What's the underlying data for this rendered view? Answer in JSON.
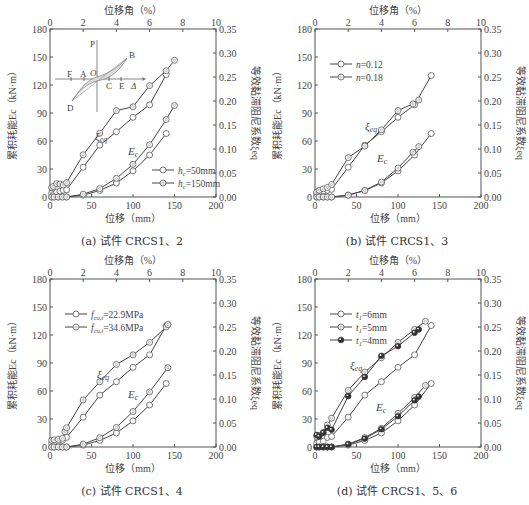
{
  "chart_data": [
    {
      "type": "line",
      "caption": "(a) 试件 CRCS1、2",
      "xlabel": "位移（mm）",
      "x2label": "位移角（%）",
      "ylabel": "累积耗能E_c（kN·m）",
      "y2label": "等效黏滞阻尼系数ξ_eq",
      "xlim": [
        0,
        200
      ],
      "x2lim": [
        0,
        10
      ],
      "ylim": [
        0,
        180
      ],
      "y2lim": [
        0,
        0.35
      ],
      "xticks": [
        0,
        50,
        100,
        150,
        200
      ],
      "x2ticks": [
        0,
        2,
        4,
        6,
        8,
        10
      ],
      "yticks": [
        0,
        30,
        60,
        90,
        120,
        150,
        180
      ],
      "y2ticks": [
        "0.00",
        "0.05",
        "0.10",
        "0.15",
        "0.20",
        "0.25",
        "0.30",
        "0.35"
      ],
      "annotations": [
        "ξeq",
        "Ec"
      ],
      "inset": {
        "labels": [
          "P",
          "B",
          "F",
          "A",
          "O",
          "C",
          "E",
          "Δ",
          "D"
        ]
      },
      "legend": [
        "h_c=50mm",
        "h_c=150mm"
      ],
      "series": [
        {
          "name": "h_c=50mm ξeq",
          "axis": "y2",
          "marker": "open-circle",
          "x": [
            2,
            4,
            8,
            12,
            16,
            20,
            40,
            60,
            80,
            100,
            120,
            140
          ],
          "y": [
            0.008,
            0.005,
            0.01,
            0.012,
            0.014,
            0.015,
            0.062,
            0.108,
            0.136,
            0.166,
            0.192,
            0.255
          ]
        },
        {
          "name": "h_c=150mm ξeq",
          "axis": "y2",
          "marker": "open-circle-dot",
          "x": [
            2,
            4,
            8,
            12,
            16,
            20,
            40,
            60,
            80,
            100,
            120,
            140,
            150
          ],
          "y": [
            0.02,
            0.022,
            0.028,
            0.027,
            0.025,
            0.03,
            0.088,
            0.133,
            0.18,
            0.188,
            0.232,
            0.263,
            0.285
          ]
        },
        {
          "name": "h_c=50mm Ec",
          "axis": "y",
          "marker": "open-circle",
          "x": [
            2,
            5,
            10,
            15,
            20,
            40,
            60,
            80,
            100,
            120,
            140
          ],
          "y": [
            0,
            0,
            0,
            0,
            0,
            2,
            7,
            15,
            28,
            45,
            68
          ]
        },
        {
          "name": "h_c=150mm Ec",
          "axis": "y",
          "marker": "open-circle-dot",
          "x": [
            2,
            5,
            10,
            15,
            20,
            40,
            60,
            80,
            100,
            120,
            140,
            150
          ],
          "y": [
            0,
            0,
            0,
            0,
            0,
            3,
            9,
            20,
            35,
            56,
            83,
            98
          ]
        }
      ]
    },
    {
      "type": "line",
      "caption": "(b) 试件 CRCS1、3",
      "xlabel": "位移（mm）",
      "x2label": "位移角（%）",
      "ylabel": "累积耗能E_c（kN·m）",
      "y2label": "等效黏滞阻尼系数ξ_eq",
      "xlim": [
        0,
        200
      ],
      "x2lim": [
        0,
        10
      ],
      "ylim": [
        0,
        180
      ],
      "y2lim": [
        0,
        0.35
      ],
      "xticks": [
        0,
        50,
        100,
        150,
        200
      ],
      "x2ticks": [
        0,
        2,
        4,
        6,
        8,
        10
      ],
      "yticks": [
        0,
        30,
        60,
        90,
        120,
        150,
        180
      ],
      "y2ticks": [
        "0.00",
        "0.05",
        "0.10",
        "0.15",
        "0.20",
        "0.25",
        "0.30",
        "0.35"
      ],
      "annotations": [
        "ξeq",
        "Ec"
      ],
      "legend": [
        "n=0.12",
        "n=0.18"
      ],
      "series": [
        {
          "name": "n=0.12 ξeq",
          "axis": "y2",
          "marker": "open-circle",
          "x": [
            2,
            5,
            10,
            15,
            20,
            40,
            60,
            80,
            100,
            120,
            140
          ],
          "y": [
            0.008,
            0.01,
            0.012,
            0.014,
            0.016,
            0.062,
            0.108,
            0.136,
            0.166,
            0.192,
            0.253
          ]
        },
        {
          "name": "n=0.18 ξeq",
          "axis": "y2",
          "marker": "open-circle-dot",
          "x": [
            2,
            5,
            10,
            15,
            20,
            40,
            60,
            80,
            100,
            118,
            125
          ],
          "y": [
            0.01,
            0.014,
            0.017,
            0.02,
            0.026,
            0.082,
            0.106,
            0.14,
            0.18,
            0.194,
            0.202
          ]
        },
        {
          "name": "n=0.12 Ec",
          "axis": "y",
          "marker": "open-circle",
          "x": [
            2,
            5,
            10,
            15,
            20,
            40,
            60,
            80,
            100,
            120,
            140
          ],
          "y": [
            0,
            0,
            0,
            0,
            0,
            2,
            7,
            15,
            28,
            45,
            68
          ]
        },
        {
          "name": "n=0.18 Ec",
          "axis": "y",
          "marker": "open-circle-dot",
          "x": [
            2,
            5,
            10,
            15,
            20,
            40,
            60,
            80,
            100,
            118,
            125
          ],
          "y": [
            0,
            0,
            0,
            0,
            0,
            2,
            7,
            16,
            31,
            48,
            54
          ]
        }
      ]
    },
    {
      "type": "line",
      "caption": "(c) 试件 CRCS1、4",
      "xlabel": "位移（mm）",
      "x2label": "位移角（%）",
      "ylabel": "累积耗能E_c（kN·m）",
      "y2label": "等效黏滞阻尼系数ξ_eq",
      "xlim": [
        0,
        200
      ],
      "x2lim": [
        0,
        10
      ],
      "ylim": [
        0,
        180
      ],
      "y2lim": [
        0,
        0.35
      ],
      "xticks": [
        0,
        50,
        100,
        150,
        200
      ],
      "x2ticks": [
        0,
        2,
        4,
        6,
        8,
        10
      ],
      "yticks": [
        0,
        30,
        60,
        90,
        120,
        150,
        180
      ],
      "y2ticks": [
        "0.00",
        "0.05",
        "0.10",
        "0.15",
        "0.20",
        "0.25",
        "0.30",
        "0.35"
      ],
      "annotations": [
        "ξeq",
        "Ec"
      ],
      "legend": [
        "f_cu,t=22.9MPa",
        "f_cu,t=34.6MPa"
      ],
      "series": [
        {
          "name": "f_cu,t=22.9MPa ξeq",
          "axis": "y2",
          "marker": "open-circle",
          "x": [
            2,
            5,
            10,
            15,
            20,
            40,
            60,
            80,
            100,
            120,
            140,
            142
          ],
          "y": [
            0.008,
            0.01,
            0.012,
            0.014,
            0.02,
            0.062,
            0.108,
            0.136,
            0.166,
            0.192,
            0.253,
            0.255
          ]
        },
        {
          "name": "f_cu,t=34.6MPa ξeq",
          "axis": "y2",
          "marker": "open-circle-dot",
          "x": [
            2,
            5,
            10,
            15,
            18,
            20,
            40,
            60,
            80,
            100,
            120,
            140,
            142
          ],
          "y": [
            0.014,
            0.015,
            0.016,
            0.018,
            0.032,
            0.04,
            0.098,
            0.136,
            0.172,
            0.192,
            0.218,
            0.25,
            0.255
          ]
        },
        {
          "name": "f_cu,t=22.9MPa Ec",
          "axis": "y",
          "marker": "open-circle",
          "x": [
            2,
            5,
            10,
            15,
            20,
            40,
            60,
            80,
            100,
            120,
            140
          ],
          "y": [
            0,
            0,
            0,
            0,
            0,
            2,
            7,
            15,
            28,
            45,
            68
          ]
        },
        {
          "name": "f_cu,t=34.6MPa Ec",
          "axis": "y",
          "marker": "open-circle-dot",
          "x": [
            2,
            5,
            10,
            15,
            20,
            40,
            60,
            80,
            100,
            120,
            142
          ],
          "y": [
            0,
            0,
            0,
            0,
            0,
            3,
            10,
            21,
            38,
            59,
            85
          ]
        }
      ]
    },
    {
      "type": "line",
      "caption": "(d) 试件 CRCS1、5、6",
      "xlabel": "位移（mm）",
      "x2label": "位移角（%）",
      "ylabel": "累积耗能E_c（kN·m）",
      "y2label": "等效黏滞阻尼系数ξ_eq",
      "xlim": [
        0,
        200
      ],
      "x2lim": [
        0,
        10
      ],
      "ylim": [
        0,
        180
      ],
      "y2lim": [
        0,
        0.35
      ],
      "xticks": [
        0,
        50,
        100,
        150,
        200
      ],
      "x2ticks": [
        0,
        2,
        4,
        6,
        8,
        10
      ],
      "yticks": [
        0,
        30,
        60,
        90,
        120,
        150,
        180
      ],
      "y2ticks": [
        "0.00",
        "0.05",
        "0.10",
        "0.15",
        "0.20",
        "0.25",
        "0.30",
        "0.35"
      ],
      "annotations": [
        "ξeq",
        "Ec"
      ],
      "legend": [
        "t_1=6mm",
        "t_1=5mm",
        "t_1=4mm"
      ],
      "series": [
        {
          "name": "t_1=6mm ξeq",
          "axis": "y2",
          "marker": "open-circle",
          "x": [
            2,
            5,
            10,
            15,
            20,
            40,
            60,
            80,
            100,
            120,
            140
          ],
          "y": [
            0.008,
            0.01,
            0.012,
            0.02,
            0.022,
            0.062,
            0.108,
            0.136,
            0.166,
            0.192,
            0.253
          ]
        },
        {
          "name": "t_1=5mm ξeq",
          "axis": "y2",
          "marker": "open-circle-dot",
          "x": [
            2,
            5,
            10,
            15,
            20,
            40,
            60,
            80,
            100,
            120,
            133
          ],
          "y": [
            0.022,
            0.024,
            0.03,
            0.046,
            0.06,
            0.118,
            0.156,
            0.186,
            0.218,
            0.245,
            0.262
          ]
        },
        {
          "name": "t_1=4mm ξeq",
          "axis": "y2",
          "marker": "filled-circle",
          "x": [
            2,
            5,
            10,
            15,
            20,
            40,
            60,
            80,
            100,
            120,
            125
          ],
          "y": [
            0.025,
            0.022,
            0.03,
            0.04,
            0.036,
            0.106,
            0.146,
            0.19,
            0.21,
            0.238,
            0.245
          ]
        },
        {
          "name": "t_1=6mm Ec",
          "axis": "y",
          "marker": "open-circle",
          "x": [
            2,
            5,
            10,
            15,
            20,
            40,
            60,
            80,
            100,
            120,
            140
          ],
          "y": [
            0,
            0,
            0,
            0,
            0,
            2,
            7,
            15,
            28,
            45,
            68
          ]
        },
        {
          "name": "t_1=5mm Ec",
          "axis": "y",
          "marker": "open-circle-dot",
          "x": [
            2,
            5,
            10,
            15,
            20,
            40,
            60,
            80,
            100,
            120,
            133
          ],
          "y": [
            0,
            0,
            0,
            0,
            0,
            3,
            10,
            20,
            36,
            53,
            66
          ]
        },
        {
          "name": "t_1=4mm Ec",
          "axis": "y",
          "marker": "filled-circle",
          "x": [
            2,
            5,
            10,
            15,
            20,
            40,
            60,
            80,
            100,
            120,
            125
          ],
          "y": [
            0,
            0,
            0,
            0,
            0,
            3,
            9,
            19,
            33,
            50,
            54
          ]
        }
      ]
    }
  ]
}
